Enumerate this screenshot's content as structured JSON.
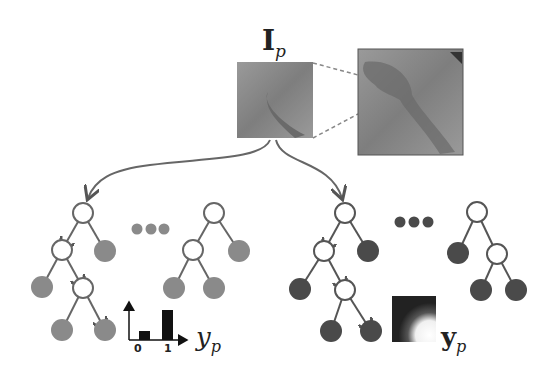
{
  "labels": {
    "input_patch_main": "I",
    "input_patch_sub": "p",
    "class_label_main": "y",
    "class_label_sub": "p",
    "struct_label_main": "y",
    "struct_label_sub": "p",
    "hist_tick_0": "0",
    "hist_tick_1": "1"
  },
  "colors": {
    "leaf_light": "#8a8a8a",
    "leaf_dark": "#4a4a4a",
    "edge": "#555555",
    "patch": "#8f8f8f",
    "bar": "#111111"
  },
  "histogram": {
    "categories": [
      "0",
      "1"
    ],
    "values": [
      0.28,
      1.0
    ]
  },
  "forests": [
    {
      "name": "classification-forest",
      "trees": 2
    },
    {
      "name": "structured-forest",
      "trees": 2
    }
  ]
}
